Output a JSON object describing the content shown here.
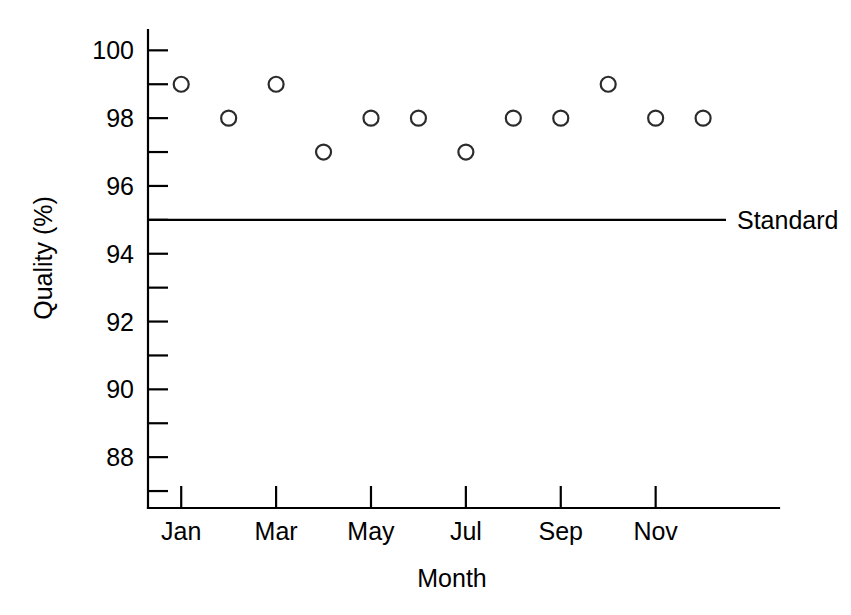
{
  "chart_data": {
    "type": "scatter",
    "title": "",
    "xlabel": "Month",
    "ylabel": "Quality (%)",
    "categories": [
      "Jan",
      "Feb",
      "Mar",
      "Apr",
      "May",
      "Jun",
      "Jul",
      "Aug",
      "Sep",
      "Oct",
      "Nov",
      "Dec"
    ],
    "values": [
      99,
      98,
      99,
      97,
      98,
      98,
      97,
      98,
      98,
      99,
      98,
      98
    ],
    "series": [
      {
        "name": "Quality",
        "values": [
          99,
          98,
          99,
          97,
          98,
          98,
          97,
          98,
          98,
          99,
          98,
          98
        ],
        "marker": "open-circle",
        "color": "#2b2b2b"
      }
    ],
    "x_tick_labels": [
      "Jan",
      "Mar",
      "May",
      "Jul",
      "Sep",
      "Nov"
    ],
    "x_tick_categories": [
      "Jan",
      "Mar",
      "May",
      "Jul",
      "Sep",
      "Nov"
    ],
    "y_tick_labels": [
      "100",
      "98",
      "96",
      "94",
      "92",
      "90",
      "88"
    ],
    "y_major_ticks": [
      100,
      98,
      96,
      94,
      92,
      90,
      88
    ],
    "y_minor_ticks": [
      99,
      97,
      95,
      93,
      91,
      89,
      87
    ],
    "ylim": [
      86.5,
      100.6
    ],
    "xlim": [
      0.3,
      13.6
    ],
    "grid": false,
    "legend": false,
    "annotations": [
      {
        "name": "standard-line",
        "label": "Standard",
        "type": "horizontal-line",
        "value": 95,
        "color": "#000000"
      }
    ]
  },
  "axis": {
    "y_title": "Quality (%)",
    "x_title": "Month"
  },
  "reference": {
    "standard_label": "Standard",
    "standard_value": 95
  },
  "colors": {
    "foreground": "#000000",
    "background": "#ffffff",
    "marker_stroke": "#2b2b2b"
  }
}
